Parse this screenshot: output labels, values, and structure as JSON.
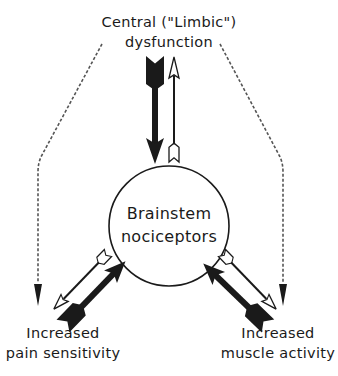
{
  "diagram": {
    "type": "pain-model-cycle",
    "colors": {
      "ink": "#1a1a1a",
      "dashed": "#555555",
      "background": "#ffffff"
    },
    "nodes": {
      "top": {
        "line1": "Central (\"Limbic\")",
        "line2": "dysfunction"
      },
      "center": {
        "line1": "Brainstem",
        "line2": "nociceptors"
      },
      "bottom_left": {
        "line1": "Increased",
        "line2": "pain sensitivity"
      },
      "bottom_right": {
        "line1": "Increased",
        "line2": "muscle activity"
      }
    },
    "edges": [
      {
        "from": "top",
        "to": "center",
        "style": "thick-solid"
      },
      {
        "from": "center",
        "to": "top",
        "style": "thin-outline"
      },
      {
        "from": "bottom_left",
        "to": "center",
        "style": "thick-solid"
      },
      {
        "from": "center",
        "to": "bottom_left",
        "style": "thin-outline"
      },
      {
        "from": "bottom_right",
        "to": "center",
        "style": "thick-solid"
      },
      {
        "from": "center",
        "to": "bottom_right",
        "style": "thin-outline"
      },
      {
        "from": "top",
        "to": "bottom_left",
        "style": "dashed"
      },
      {
        "from": "top",
        "to": "bottom_right",
        "style": "dashed"
      }
    ]
  }
}
